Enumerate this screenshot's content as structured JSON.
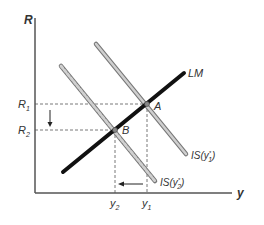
{
  "diagram": {
    "axes": {
      "y_label": "R",
      "x_label": "y"
    },
    "curves": {
      "lm": {
        "label": "LM",
        "color": "#111111"
      },
      "is1": {
        "label_main": "IS(y",
        "label_sub": "1",
        "label_sup": "*",
        "label_close": ")",
        "color": "#a8a8a8"
      },
      "is2": {
        "label_main": "IS(y",
        "label_sub": "2",
        "label_sup": "*",
        "label_close": ")",
        "color": "#a8a8a8"
      }
    },
    "points": {
      "a": "A",
      "b": "B"
    },
    "ticks": {
      "r1_main": "R",
      "r1_sub": "1",
      "r2_main": "R",
      "r2_sub": "2",
      "y1_main": "y",
      "y1_sub": "1",
      "y2_main": "y",
      "y2_sub": "2"
    },
    "arrows": {
      "interest_rate_shift": "down",
      "output_shift": "left"
    }
  }
}
